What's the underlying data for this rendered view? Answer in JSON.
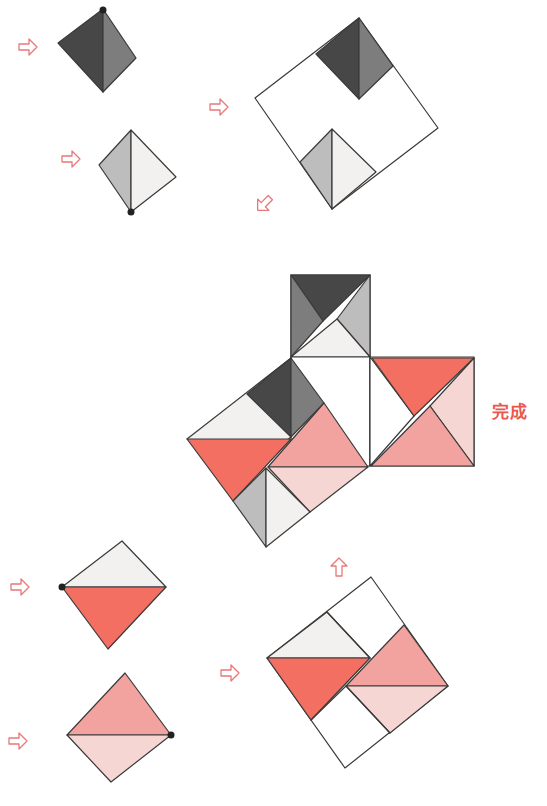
{
  "colors": {
    "black": "#474747",
    "dark_gray": "#7d7d7d",
    "light_gray": "#bdbdbd",
    "off_white": "#f3f1f0",
    "white": "#ffffff",
    "red": "#f36f62",
    "pink": "#f2a3a0",
    "light_pink": "#f6d6d3",
    "arrow": "#e8787a",
    "label": "#e8584f"
  },
  "completion_label": "完成",
  "steps": [
    {
      "name": "step-1-dark-pair",
      "pieces": [
        "black",
        "dark_gray"
      ],
      "marked_vertex": "top"
    },
    {
      "name": "step-2-light-pair",
      "pieces": [
        "light_gray",
        "off_white"
      ],
      "marked_vertex": "bottom"
    },
    {
      "name": "step-3-gray-square",
      "pieces": [
        "black",
        "dark_gray",
        "light_gray",
        "off_white",
        "white"
      ]
    },
    {
      "name": "step-4-red-pair",
      "pieces": [
        "off_white",
        "red"
      ],
      "marked_vertex": "left"
    },
    {
      "name": "step-5-pink-pair",
      "pieces": [
        "pink",
        "light_pink"
      ],
      "marked_vertex": "right"
    },
    {
      "name": "step-6-red-square",
      "pieces": [
        "off_white",
        "red",
        "pink",
        "light_pink",
        "white"
      ]
    },
    {
      "name": "finished-figure",
      "pieces": [
        "black",
        "dark_gray",
        "light_gray",
        "off_white",
        "white",
        "red",
        "pink",
        "light_pink"
      ]
    }
  ],
  "arrows": [
    {
      "name": "arrow-step-1",
      "direction": "right"
    },
    {
      "name": "arrow-step-2",
      "direction": "right"
    },
    {
      "name": "arrow-step-3",
      "direction": "right"
    },
    {
      "name": "arrow-step-3-out",
      "direction": "down-left"
    },
    {
      "name": "arrow-step-4",
      "direction": "right"
    },
    {
      "name": "arrow-step-5",
      "direction": "right"
    },
    {
      "name": "arrow-step-6",
      "direction": "right"
    },
    {
      "name": "arrow-step-6-out",
      "direction": "up"
    }
  ]
}
